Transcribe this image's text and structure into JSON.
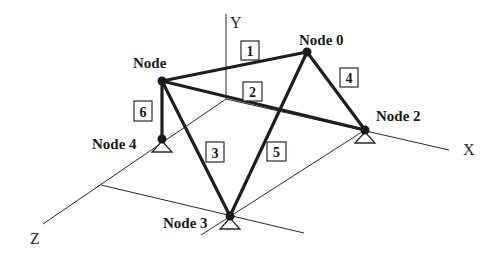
{
  "diagram": {
    "colors": {
      "background": "#ffffff",
      "ink": "#1a1a1a"
    },
    "axes": {
      "x": {
        "label": "X",
        "x1": 226,
        "y1": 99,
        "x2": 449,
        "y2": 150,
        "label_x": 463,
        "label_y": 155
      },
      "y": {
        "label": "Y",
        "x1": 226,
        "y1": 99,
        "x2": 226,
        "y2": 14,
        "label_x": 230,
        "label_y": 28
      },
      "z": {
        "label": "Z",
        "x1": 226,
        "y1": 99,
        "x2": 43,
        "y2": 224,
        "label_x": 30,
        "label_y": 244
      }
    },
    "guide_lines": [
      {
        "x1": 101,
        "y1": 185,
        "x2": 304,
        "y2": 233
      },
      {
        "x1": 365,
        "y1": 130,
        "x2": 201,
        "y2": 235
      }
    ],
    "nodes": [
      {
        "id": "node-top-left",
        "label": "Node",
        "x": 162,
        "y": 81,
        "label_x": 133,
        "label_y": 68,
        "support": false
      },
      {
        "id": "node-0",
        "label": "Node 0",
        "x": 307,
        "y": 52,
        "label_x": 299,
        "label_y": 45,
        "support": false
      },
      {
        "id": "node-2",
        "label": "Node 2",
        "x": 365,
        "y": 130,
        "label_x": 376,
        "label_y": 121,
        "support": true
      },
      {
        "id": "node-3",
        "label": "Node 3",
        "x": 230,
        "y": 216,
        "label_x": 163,
        "label_y": 228,
        "support": true
      },
      {
        "id": "node-4",
        "label": "Node 4",
        "x": 162,
        "y": 139,
        "label_x": 92,
        "label_y": 149,
        "support": true
      }
    ],
    "members": [
      {
        "number": "1",
        "from": "node-top-left",
        "to": "node-0",
        "box_x": 241,
        "box_y": 41,
        "box_w": 18,
        "box_h": 19
      },
      {
        "number": "2",
        "from": "node-top-left",
        "to": "node-2",
        "box_x": 243,
        "box_y": 82,
        "box_w": 19,
        "box_h": 19
      },
      {
        "number": "3",
        "from": "node-top-left",
        "to": "node-3",
        "box_x": 206,
        "box_y": 142,
        "box_w": 18,
        "box_h": 20
      },
      {
        "number": "4",
        "from": "node-0",
        "to": "node-2",
        "box_x": 340,
        "box_y": 68,
        "box_w": 18,
        "box_h": 19
      },
      {
        "number": "5",
        "from": "node-0",
        "to": "node-3",
        "box_x": 267,
        "box_y": 142,
        "box_w": 19,
        "box_h": 19
      },
      {
        "number": "6",
        "from": "node-top-left",
        "to": "node-4",
        "box_x": 134,
        "box_y": 101,
        "box_w": 18,
        "box_h": 20
      }
    ]
  }
}
